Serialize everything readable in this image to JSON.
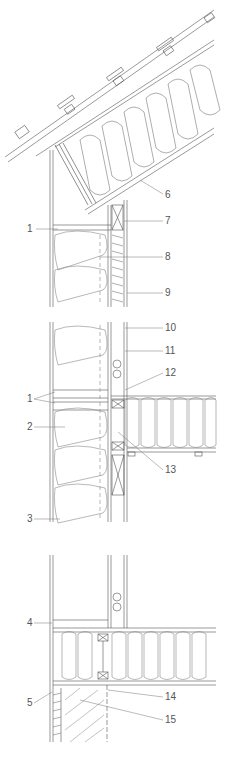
{
  "diagram": {
    "type": "construction-section-detail",
    "colors": {
      "line": "#555555",
      "insulation": "#888888",
      "hatch": "#777777",
      "background": "#ffffff"
    },
    "sections": [
      {
        "name": "roof-eaves-junction"
      },
      {
        "name": "intermediate-floor-junction"
      },
      {
        "name": "ground-floor-foundation-junction"
      }
    ],
    "labels": [
      {
        "id": "1a",
        "text": "1",
        "x": 30,
        "y": 229
      },
      {
        "id": "6",
        "text": "6",
        "x": 165,
        "y": 195
      },
      {
        "id": "7",
        "text": "7",
        "x": 165,
        "y": 221
      },
      {
        "id": "8",
        "text": "8",
        "x": 165,
        "y": 257
      },
      {
        "id": "9",
        "text": "9",
        "x": 165,
        "y": 293
      },
      {
        "id": "10",
        "text": "10",
        "x": 165,
        "y": 328
      },
      {
        "id": "11",
        "text": "11",
        "x": 165,
        "y": 351
      },
      {
        "id": "12",
        "text": "12",
        "x": 165,
        "y": 373
      },
      {
        "id": "1b",
        "text": "1",
        "x": 27,
        "y": 399
      },
      {
        "id": "2",
        "text": "2",
        "x": 27,
        "y": 427
      },
      {
        "id": "13",
        "text": "13",
        "x": 165,
        "y": 470
      },
      {
        "id": "3",
        "text": "3",
        "x": 27,
        "y": 519
      },
      {
        "id": "4",
        "text": "4",
        "x": 27,
        "y": 623
      },
      {
        "id": "5",
        "text": "5",
        "x": 27,
        "y": 703
      },
      {
        "id": "14",
        "text": "14",
        "x": 165,
        "y": 697
      },
      {
        "id": "15",
        "text": "15",
        "x": 165,
        "y": 720
      }
    ]
  }
}
